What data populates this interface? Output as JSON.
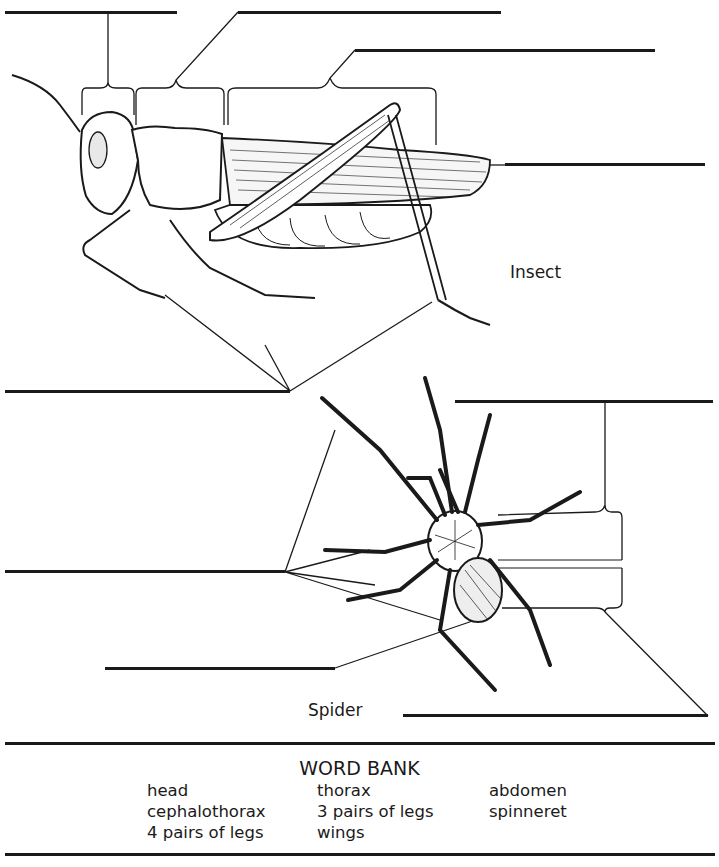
{
  "worksheet": {
    "insect_caption": "Insect",
    "spider_caption": "Spider",
    "insect_blanks": [
      {
        "id": "insect-head-blank",
        "x": 5,
        "y": 11,
        "w": 172
      },
      {
        "id": "insect-thorax-blank",
        "x": 238,
        "y": 11,
        "w": 263
      },
      {
        "id": "insect-abdomen-blank",
        "x": 355,
        "y": 49,
        "w": 300
      },
      {
        "id": "insect-wings-blank",
        "x": 505,
        "y": 163,
        "w": 200
      },
      {
        "id": "insect-legs-blank",
        "x": 5,
        "y": 390,
        "w": 285
      }
    ],
    "spider_blanks": [
      {
        "id": "spider-cephalothorax-blank",
        "x": 455,
        "y": 400,
        "w": 258
      },
      {
        "id": "spider-legs-blank",
        "x": 5,
        "y": 570,
        "w": 280
      },
      {
        "id": "spider-spinneret-blank",
        "x": 105,
        "y": 667,
        "w": 230
      },
      {
        "id": "spider-abdomen-blank",
        "x": 403,
        "y": 714,
        "w": 305
      }
    ]
  },
  "word_bank": {
    "title": "WORD BANK",
    "columns": [
      [
        "head",
        "cephalothorax",
        "4 pairs of legs"
      ],
      [
        "thorax",
        "3 pairs of legs",
        "wings"
      ],
      [
        "abdomen",
        "spinneret"
      ]
    ]
  }
}
